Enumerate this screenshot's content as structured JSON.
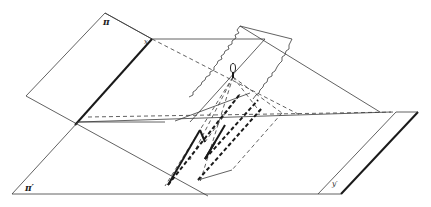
{
  "diagram": {
    "labels": {
      "plane_pi": "π",
      "plane_pi_prime": "π′",
      "line_x": "x",
      "line_y_prime": "y′",
      "center": "O"
    },
    "colors": {
      "line": "#3a3a3a",
      "heavy_line": "#1a1a1a",
      "background": "#ffffff"
    }
  }
}
